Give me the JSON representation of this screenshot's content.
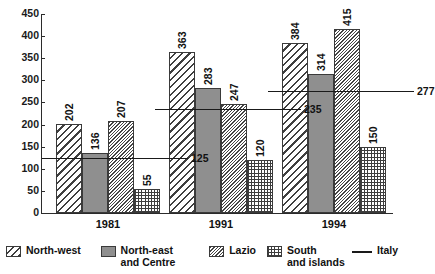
{
  "chart_data": {
    "type": "bar",
    "title": "",
    "xlabel": "",
    "ylabel": "",
    "categories": [
      "1981",
      "1991",
      "1994"
    ],
    "ylim": [
      0,
      450
    ],
    "yticks": [
      0,
      50,
      100,
      150,
      200,
      250,
      300,
      350,
      400,
      450
    ],
    "grid": false,
    "legend_position": "bottom",
    "series": [
      {
        "name": "North-west",
        "values": [
          202,
          363,
          384
        ],
        "pattern": "diagonal-hatch"
      },
      {
        "name": "North-east and Centre",
        "values": [
          136,
          283,
          314
        ],
        "pattern": "solid-gray"
      },
      {
        "name": "Lazio",
        "values": [
          207,
          247,
          415
        ],
        "pattern": "dense-diagonal-hatch"
      },
      {
        "name": "South and islands",
        "values": [
          55,
          120,
          150
        ],
        "pattern": "grid-hatch"
      }
    ],
    "reference_line": {
      "name": "Italy",
      "values": [
        125,
        235,
        277
      ],
      "style": "solid-line"
    }
  },
  "legend": {
    "items": [
      {
        "label": "North-west",
        "swatch": "diagonal-hatch-swatch"
      },
      {
        "label": "North-east\nand Centre",
        "label_line1": "North-east",
        "label_line2": "and Centre",
        "swatch": "solid-gray-swatch"
      },
      {
        "label": "Lazio",
        "swatch": "dense-diagonal-hatch-swatch"
      },
      {
        "label": "South\nand islands",
        "label_line1": "South",
        "label_line2": "and islands",
        "swatch": "grid-hatch-swatch"
      },
      {
        "label": "Italy",
        "swatch": "reference-line-swatch"
      }
    ]
  },
  "axis": {
    "y_tick_labels": [
      "450",
      "400",
      "350",
      "300",
      "250",
      "200",
      "150",
      "100",
      "50",
      "0"
    ],
    "x_tick_labels": [
      "1981",
      "1991",
      "1994"
    ]
  },
  "colors": {
    "ink": "#1a1a1a",
    "solid_gray": "#8f8f8f",
    "background": "#ffffff"
  }
}
